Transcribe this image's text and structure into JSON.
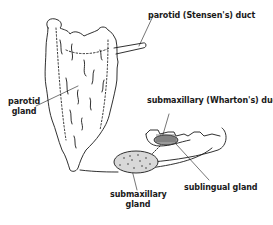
{
  "diagram": {
    "colors": {
      "ink": "#1a1a1a",
      "background": "#ffffff"
    },
    "labels": {
      "parotid_duct": "parotid (Stensen's) duct",
      "parotid_gland_line1": "parotid",
      "parotid_gland_line2": "gland",
      "submaxillary_duct": "submaxillary (Wharton's) duct",
      "sublingual_gland": "sublingual gland",
      "submaxillary_gland_line1": "submaxillary",
      "submaxillary_gland_line2": "gland"
    }
  }
}
